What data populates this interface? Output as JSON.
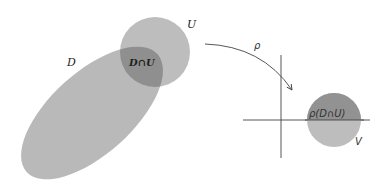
{
  "diagram": {
    "type": "set-mapping",
    "labels": {
      "domain": "D",
      "open_set": "U",
      "intersection": "D∩U",
      "map": "ρ",
      "image": "ρ(D∩U)",
      "target": "V"
    },
    "colors": {
      "light_fill": "#b8b8b8",
      "dark_fill": "#8e8e8e",
      "stroke": "#444444",
      "background": "#ffffff"
    }
  }
}
